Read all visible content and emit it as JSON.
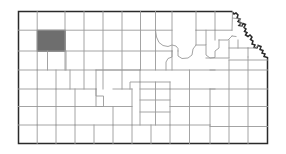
{
  "figure": {
    "type": "choropleth-locator-map",
    "subject": "Kansas",
    "description": "Outline map of the state of Kansas showing county boundaries with a single county shaded in gray in the northwestern part of the state",
    "width_px": 286,
    "height_px": 154,
    "background_color": "#ffffff"
  },
  "colors": {
    "state_outline": "#2a2a2a",
    "county_line": "#9a9a9a",
    "county_fill": "#ffffff",
    "highlight_fill": "#6e6e6e",
    "highlight_stroke": "#5a5a5a"
  },
  "map": {
    "state_name": "Kansas",
    "county_grid": {
      "columns": 13,
      "rows": 7,
      "note": "Regular rectangular county grid west and central; irregular county shapes in the east and northeast along the Missouri River"
    },
    "highlighted_county": {
      "label": "highlighted-county",
      "fill": "#6e6e6e",
      "region": "northwest",
      "grid_row": 2,
      "grid_column": 2,
      "bbox_px": {
        "x": 37,
        "y": 30,
        "width": 28,
        "height": 21
      }
    },
    "borders": {
      "north": "straight",
      "south": "straight",
      "west": "straight",
      "east": "irregular (Missouri River)"
    },
    "bbox_px": {
      "x": 18,
      "y": 11,
      "width": 250,
      "height": 132
    }
  },
  "chart_data": {
    "type": "map",
    "title": "",
    "legend": [],
    "series": [
      {
        "name": "highlighted",
        "value": 1,
        "color": "#6e6e6e"
      },
      {
        "name": "not-highlighted",
        "value": 104,
        "color": "#ffffff"
      }
    ]
  }
}
